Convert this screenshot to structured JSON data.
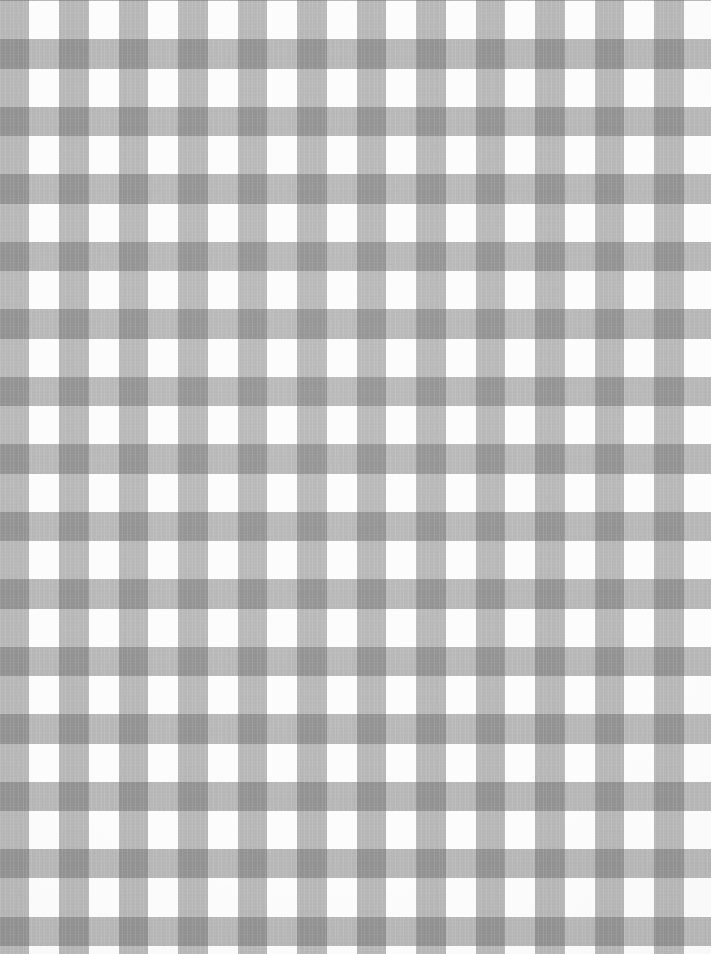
{
  "image": {
    "subject": "gingham-check-fabric",
    "title": "Gray and White Gingham Check Fabric",
    "description": "Close-up flat-lay photograph of woven gingham check cotton fabric in gray and white",
    "width_px": 711,
    "height_px": 954,
    "orientation": "portrait",
    "alt_text": "Gray and white gingham checked fabric"
  },
  "pattern": {
    "name": "gingham",
    "weave": "plain-weave",
    "tone_count": 3,
    "check_period_px": 59.5,
    "stripe_width_px": 29.2,
    "gap_width_px": 30.3,
    "columns_visible": 12,
    "rows_visible": 16,
    "warp_phase_offset_px": 0,
    "weft_phase_offset_px": 8,
    "thread_striation": "fine vertical warp lines visible within gray squares"
  },
  "colors": {
    "white": "#fcfcfc",
    "mid_gray": "#b4b4b4",
    "dark_gray": "#8a8a8a",
    "yarn_gray": "#686868",
    "background": "#ffffff"
  },
  "tones": [
    {
      "name": "white-square",
      "role": "ground (no yarn)",
      "hex": "#fcfcfc"
    },
    {
      "name": "mid-gray-square",
      "role": "single yarn overlap",
      "hex": "#b4b4b4"
    },
    {
      "name": "dark-gray-square",
      "role": "warp + weft yarn overlap",
      "hex": "#8a8a8a"
    }
  ]
}
